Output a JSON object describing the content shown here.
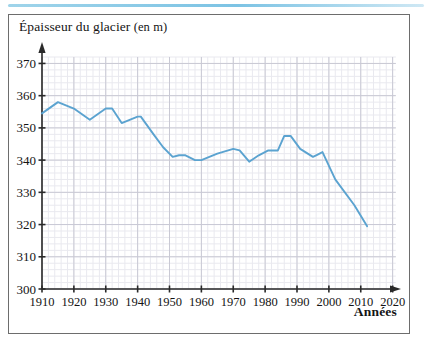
{
  "figure": {
    "title_main": "Épaisseur du glacier",
    "title_unit": "(en m)",
    "x_axis_name": "Années"
  },
  "chart_data": {
    "type": "line",
    "xlabel": "Années",
    "ylabel": "Épaisseur du glacier (en m)",
    "unit": "m",
    "xlim": [
      1910,
      2022
    ],
    "ylim": [
      300,
      372
    ],
    "xticks": [
      1910,
      1920,
      1930,
      1940,
      1950,
      1960,
      1970,
      1980,
      1990,
      2000,
      2010,
      2020
    ],
    "yticks": [
      300,
      310,
      320,
      330,
      340,
      350,
      360,
      370
    ],
    "xtick_step": 10,
    "ytick_step": 10,
    "minor_x_step": 2,
    "minor_y_step": 2,
    "grid": true,
    "legend": null,
    "line_color": "#5ba3d0",
    "series": [
      {
        "name": "Épaisseur du glacier",
        "x": [
          1910,
          1915,
          1920,
          1925,
          1930,
          1932,
          1935,
          1940,
          1941,
          1945,
          1948,
          1951,
          1953,
          1955,
          1958,
          1960,
          1965,
          1970,
          1972,
          1975,
          1978,
          1981,
          1984,
          1986,
          1988,
          1991,
          1995,
          1996,
          1998,
          2002,
          2008,
          2012
        ],
        "y": [
          354.5,
          358,
          356,
          352.5,
          356,
          356,
          351.5,
          353.5,
          353.5,
          348,
          344,
          341,
          341.5,
          341.5,
          340,
          340,
          342,
          343.5,
          343,
          339.5,
          341.5,
          343,
          343,
          347.5,
          347.5,
          343.5,
          341,
          341.5,
          342.5,
          334,
          326,
          319.5
        ]
      }
    ],
    "xtick_labels": [
      "1910",
      "1920",
      "1930",
      "1940",
      "1950",
      "1960",
      "1970",
      "1980",
      "1990",
      "2000",
      "2010",
      "2020"
    ],
    "ytick_labels": [
      "300",
      "310",
      "320",
      "330",
      "340",
      "350",
      "360",
      "370"
    ]
  },
  "colors": {
    "line": "#5ba3d0",
    "grid_minor": "#e9e9ef",
    "grid_major": "#c9c9d4",
    "axis": "#2a2a2a",
    "frame": "#6d6d6d",
    "top_rule": "#7cc3e4"
  }
}
